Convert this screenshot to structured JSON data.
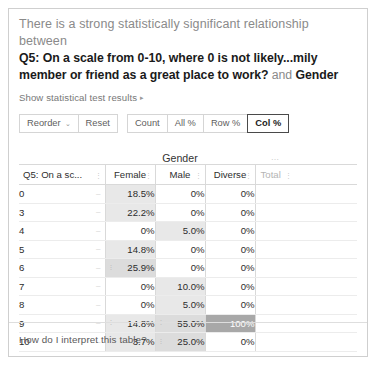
{
  "headline": {
    "lead": "There is a strong statistically significant relationship between",
    "question": "Q5: On a scale from 0-10, where 0 is not likely...mily member or friend as a great place to work?",
    "conjunction": " and ",
    "variable": "Gender"
  },
  "stat_link": {
    "label": "Show statistical test results",
    "caret": "▸"
  },
  "toolbar": {
    "reorder_label": "Reorder",
    "reorder_caret": "⌄",
    "reset_label": "Reset",
    "count_label": "Count",
    "all_pct_label": "All %",
    "row_pct_label": "Row %",
    "col_pct_label": "Col %",
    "selected": "Col %"
  },
  "table": {
    "group_header": "Gender",
    "group_dots": "⋯",
    "row_header": "Q5: On a sc...",
    "sort_mark": "⋮",
    "row_dash": "–",
    "grip": "⋮",
    "columns": [
      "Female",
      "Male",
      "Diverse"
    ],
    "total_header": "Total",
    "rows": [
      {
        "label": "0",
        "values": [
          "18.5%",
          "0%",
          "0%"
        ]
      },
      {
        "label": "3",
        "values": [
          "22.2%",
          "0%",
          "0%"
        ]
      },
      {
        "label": "4",
        "values": [
          "0%",
          "5.0%",
          "0%"
        ]
      },
      {
        "label": "5",
        "values": [
          "14.8%",
          "0%",
          "0%"
        ]
      },
      {
        "label": "6",
        "values": [
          "25.9%",
          "0%",
          "0%"
        ]
      },
      {
        "label": "7",
        "values": [
          "0%",
          "10.0%",
          "0%"
        ]
      },
      {
        "label": "8",
        "values": [
          "0%",
          "5.0%",
          "0%"
        ]
      },
      {
        "label": "9",
        "values": [
          "14.8%",
          "55.0%",
          "100%"
        ]
      },
      {
        "label": "10",
        "values": [
          "3.7%",
          "25.0%",
          "0%"
        ]
      }
    ],
    "total_row": {
      "label": "Total",
      "values": [
        "100%",
        "100%",
        "100%"
      ]
    },
    "shading": {
      "none": "#ffffff",
      "light": "#e8e8e8",
      "mid": "#dcdcdc",
      "dark": "#a8a8a8"
    },
    "cell_shades": [
      [
        "light",
        "none",
        "none"
      ],
      [
        "light",
        "none",
        "none"
      ],
      [
        "none",
        "light",
        "none"
      ],
      [
        "light",
        "none",
        "none"
      ],
      [
        "mid",
        "none",
        "none"
      ],
      [
        "none",
        "light",
        "none"
      ],
      [
        "none",
        "light",
        "none"
      ],
      [
        "light",
        "mid",
        "dark"
      ],
      [
        "light",
        "mid",
        "none"
      ]
    ],
    "total_row_shade": "light"
  },
  "footer": {
    "help_link": "How do I interpret this table?"
  }
}
